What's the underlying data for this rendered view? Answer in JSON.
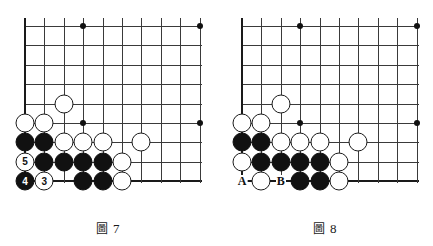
{
  "page": {
    "background": "#ffffff",
    "stone_black_color": "#111111",
    "stone_white_color": "#ffffff",
    "line_color": "#3a3a3a",
    "edge_color": "#1a1a1a"
  },
  "board_geometry": {
    "origin_x": 25,
    "origin_y": 26,
    "spacing": 19.4,
    "cols": 10,
    "rows": 9,
    "left_edge_col": 0,
    "bottom_edge_row": 8
  },
  "figures": [
    {
      "id": "figure-7",
      "caption_cjk": "圖",
      "caption_number": "7",
      "caption_full": "圖 7",
      "star_points": [
        {
          "col": 3,
          "row": 0
        },
        {
          "col": 9,
          "row": 0
        },
        {
          "col": 3,
          "row": 5
        },
        {
          "col": 9,
          "row": 5
        }
      ],
      "stones": [
        {
          "col": 2,
          "row": 4,
          "color": "white",
          "label": ""
        },
        {
          "col": 0,
          "row": 5,
          "color": "white",
          "label": ""
        },
        {
          "col": 1,
          "row": 5,
          "color": "white",
          "label": ""
        },
        {
          "col": 0,
          "row": 6,
          "color": "black",
          "label": ""
        },
        {
          "col": 1,
          "row": 6,
          "color": "black",
          "label": ""
        },
        {
          "col": 2,
          "row": 6,
          "color": "white",
          "label": ""
        },
        {
          "col": 3,
          "row": 6,
          "color": "white",
          "label": ""
        },
        {
          "col": 4,
          "row": 6,
          "color": "white",
          "label": ""
        },
        {
          "col": 6,
          "row": 6,
          "color": "white",
          "label": ""
        },
        {
          "col": 0,
          "row": 7,
          "color": "white",
          "label": "5"
        },
        {
          "col": 1,
          "row": 7,
          "color": "black",
          "label": ""
        },
        {
          "col": 2,
          "row": 7,
          "color": "black",
          "label": ""
        },
        {
          "col": 3,
          "row": 7,
          "color": "black",
          "label": ""
        },
        {
          "col": 4,
          "row": 7,
          "color": "black",
          "label": ""
        },
        {
          "col": 5,
          "row": 7,
          "color": "white",
          "label": ""
        },
        {
          "col": 0,
          "row": 8,
          "color": "black",
          "label": "4"
        },
        {
          "col": 1,
          "row": 8,
          "color": "white",
          "label": "3"
        },
        {
          "col": 3,
          "row": 8,
          "color": "black",
          "label": ""
        },
        {
          "col": 4,
          "row": 8,
          "color": "black",
          "label": ""
        },
        {
          "col": 5,
          "row": 8,
          "color": "white",
          "label": ""
        }
      ],
      "point_labels": []
    },
    {
      "id": "figure-8",
      "caption_cjk": "圖",
      "caption_number": "8",
      "caption_full": "圖 8",
      "star_points": [
        {
          "col": 3,
          "row": 0
        },
        {
          "col": 9,
          "row": 0
        },
        {
          "col": 3,
          "row": 5
        },
        {
          "col": 9,
          "row": 5
        }
      ],
      "stones": [
        {
          "col": 2,
          "row": 4,
          "color": "white",
          "label": ""
        },
        {
          "col": 0,
          "row": 5,
          "color": "white",
          "label": ""
        },
        {
          "col": 1,
          "row": 5,
          "color": "white",
          "label": ""
        },
        {
          "col": 0,
          "row": 6,
          "color": "black",
          "label": ""
        },
        {
          "col": 1,
          "row": 6,
          "color": "black",
          "label": ""
        },
        {
          "col": 2,
          "row": 6,
          "color": "white",
          "label": ""
        },
        {
          "col": 3,
          "row": 6,
          "color": "white",
          "label": ""
        },
        {
          "col": 4,
          "row": 6,
          "color": "white",
          "label": ""
        },
        {
          "col": 6,
          "row": 6,
          "color": "white",
          "label": ""
        },
        {
          "col": 0,
          "row": 7,
          "color": "white",
          "label": ""
        },
        {
          "col": 1,
          "row": 7,
          "color": "black",
          "label": ""
        },
        {
          "col": 2,
          "row": 7,
          "color": "black",
          "label": ""
        },
        {
          "col": 3,
          "row": 7,
          "color": "black",
          "label": ""
        },
        {
          "col": 4,
          "row": 7,
          "color": "black",
          "label": ""
        },
        {
          "col": 5,
          "row": 7,
          "color": "white",
          "label": ""
        },
        {
          "col": 1,
          "row": 8,
          "color": "white",
          "label": ""
        },
        {
          "col": 3,
          "row": 8,
          "color": "black",
          "label": ""
        },
        {
          "col": 4,
          "row": 8,
          "color": "black",
          "label": ""
        },
        {
          "col": 5,
          "row": 8,
          "color": "white",
          "label": ""
        }
      ],
      "point_labels": [
        {
          "col": 0,
          "row": 8,
          "text": "A"
        },
        {
          "col": 2,
          "row": 8,
          "text": "B"
        }
      ]
    }
  ]
}
